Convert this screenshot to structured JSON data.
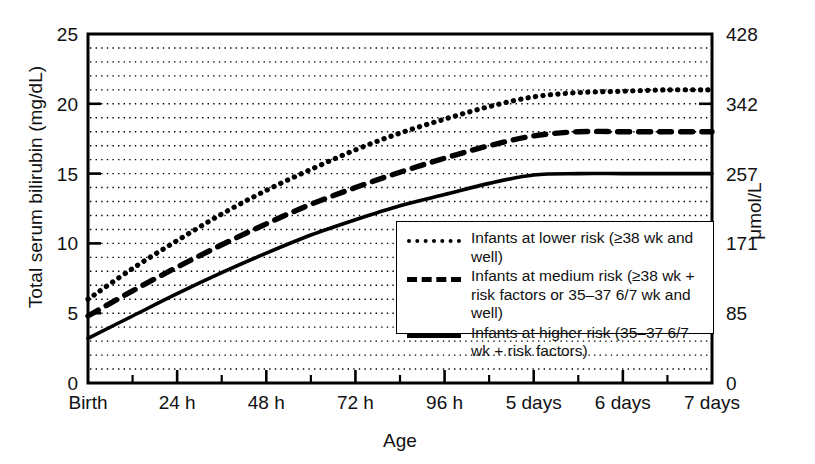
{
  "chart_data": {
    "type": "line",
    "title": "",
    "subtitle": "",
    "xlabel": "Age",
    "ylabel": "Total serum bilirubin (mg/dL)",
    "ylabel_right": "μmol/L",
    "grid": true,
    "grid_minor_step": 1,
    "legend_position": "inside-lower-right",
    "xlim": [
      0,
      7
    ],
    "ylim": [
      0,
      25
    ],
    "ylim_right": [
      0,
      428
    ],
    "x_tick_labels": [
      "Birth",
      "24 h",
      "48 h",
      "72 h",
      "96 h",
      "5 days",
      "6 days",
      "7 days"
    ],
    "x_tick_values": [
      0,
      1,
      2,
      3,
      4,
      5,
      6,
      7
    ],
    "y_tick_labels_left": [
      "0",
      "5",
      "10",
      "15",
      "20",
      "25"
    ],
    "y_tick_values_left": [
      0,
      5,
      10,
      15,
      20,
      25
    ],
    "y_tick_labels_right": [
      "0",
      "85",
      "171",
      "257",
      "342",
      "428"
    ],
    "y_tick_values_right": [
      0,
      85,
      171,
      257,
      342,
      428
    ],
    "x": [
      0,
      0.5,
      1,
      1.5,
      2,
      2.5,
      3,
      3.5,
      4,
      4.5,
      5,
      5.5,
      6,
      6.5,
      7
    ],
    "series": [
      {
        "name": "Infants at lower risk (≥38 wk and well)",
        "style": "dotted",
        "color": "#000000",
        "values": [
          6.0,
          8.2,
          10.2,
          12.1,
          13.8,
          15.3,
          16.7,
          17.9,
          18.9,
          19.8,
          20.5,
          20.8,
          20.9,
          21.0,
          21.0
        ]
      },
      {
        "name": "Infants at medium risk (≥38 wk + risk factors or 35–37 6/7 wk and well)",
        "style": "dashed",
        "color": "#000000",
        "values": [
          4.8,
          6.6,
          8.3,
          9.9,
          11.4,
          12.8,
          14.0,
          15.1,
          16.1,
          17.0,
          17.7,
          18.0,
          18.0,
          18.0,
          18.0
        ]
      },
      {
        "name": "Infants at higher risk (35–37 6/7 wk + risk factors)",
        "style": "solid",
        "color": "#000000",
        "values": [
          3.2,
          4.8,
          6.4,
          7.9,
          9.3,
          10.6,
          11.7,
          12.7,
          13.5,
          14.3,
          14.9,
          15.0,
          15.0,
          15.0,
          15.0
        ]
      }
    ]
  },
  "legend": {
    "entries": [
      {
        "key": "dotted-line-key",
        "text": "Infants at lower risk (≥38 wk and well)"
      },
      {
        "key": "dashed-line-key",
        "text": "Infants at medium risk (≥38 wk + risk factors or 35–37 6/7 wk and well)"
      },
      {
        "key": "solid-line-key",
        "text": "Infants at higher risk (35–37 6/7 wk + risk factors)"
      }
    ]
  }
}
